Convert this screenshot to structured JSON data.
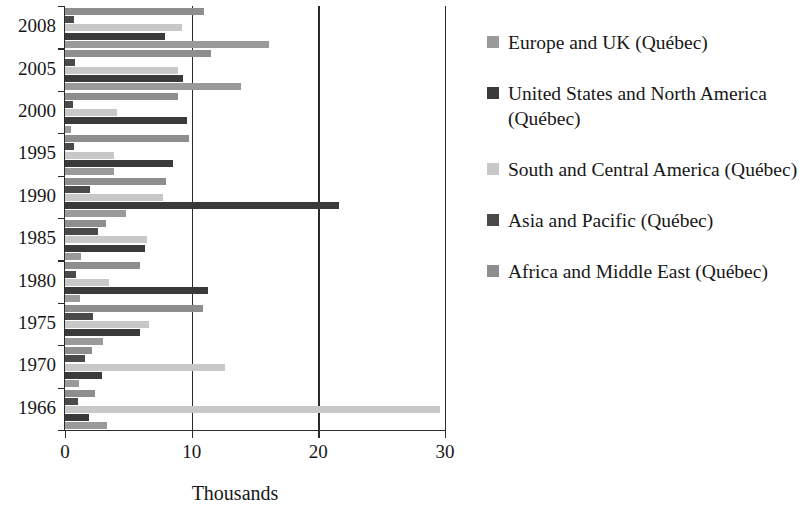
{
  "chart_data": {
    "type": "bar",
    "orientation": "horizontal",
    "title": "",
    "xlabel": "Thousands",
    "ylabel": "",
    "xlim": [
      0,
      30
    ],
    "xticks": [
      0,
      10,
      20,
      30
    ],
    "xtick_labels": [
      "0",
      "10",
      "20",
      "30"
    ],
    "categories": [
      "2008",
      "2005",
      "2000",
      "1995",
      "1990",
      "1985",
      "1980",
      "1975",
      "1970",
      "1966"
    ],
    "grid": "vertical-major",
    "legend_position": "right",
    "series": [
      {
        "name": "Europe and UK (Québec)",
        "color": "#9a9a9a",
        "values": [
          16.1,
          13.9,
          0.5,
          3.9,
          4.8,
          1.3,
          1.2,
          3.0,
          1.1,
          3.3
        ]
      },
      {
        "name": "United States and North America (Québec)",
        "color": "#3a3a3a",
        "values": [
          7.9,
          9.3,
          9.6,
          8.5,
          21.6,
          6.3,
          11.3,
          5.9,
          2.9,
          1.9
        ]
      },
      {
        "name": "South and Central America (Québec)",
        "color": "#c8c8c8",
        "values": [
          9.2,
          8.9,
          4.1,
          3.9,
          7.7,
          6.5,
          3.5,
          6.6,
          12.6,
          29.6
        ]
      },
      {
        "name": "Asia and Pacific (Québec)",
        "color": "#4a4a4a",
        "values": [
          0.7,
          0.8,
          0.6,
          0.7,
          2.0,
          2.6,
          0.9,
          2.2,
          1.6,
          1.0
        ]
      },
      {
        "name": "Africa and Middle East (Québec)",
        "color": "#8e8e8e",
        "values": [
          11.0,
          11.5,
          8.9,
          9.8,
          8.0,
          3.2,
          5.9,
          10.9,
          2.1,
          2.4
        ]
      }
    ]
  },
  "legend": {
    "items": [
      {
        "label": "Europe and UK (Québec)",
        "color": "#9a9a9a"
      },
      {
        "label": "United States and North America (Québec)",
        "color": "#3a3a3a"
      },
      {
        "label": "South and Central America (Québec)",
        "color": "#c8c8c8"
      },
      {
        "label": "Asia and Pacific (Québec)",
        "color": "#4a4a4a"
      },
      {
        "label": "Africa and Middle East (Québec)",
        "color": "#8e8e8e"
      }
    ]
  }
}
